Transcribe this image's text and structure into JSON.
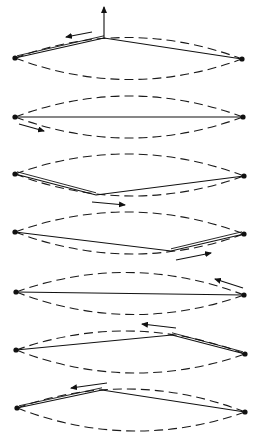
{
  "diagram": {
    "title": "",
    "colors": {
      "ink": "#111111",
      "background": "#ffffff"
    },
    "envelope_amplitude": 21,
    "panels": [
      {
        "id": 1,
        "left": [
          15,
          58
        ],
        "right": [
          242,
          59
        ],
        "kink": [
          104,
          38
        ],
        "doubled": "left",
        "arrows": [
          {
            "from": [
              104,
              38
            ],
            "to": [
              104,
              7
            ],
            "kind": "force-up-icon"
          },
          {
            "from": [
              92,
              32
            ],
            "to": [
              66,
              37
            ],
            "kind": "kink-direction-icon"
          }
        ]
      },
      {
        "id": 2,
        "left": [
          15,
          117
        ],
        "right": [
          243,
          117
        ],
        "kink": null,
        "doubled": "none",
        "arrows": [
          {
            "from": [
              19,
              124
            ],
            "to": [
              44,
              131
            ],
            "kind": "kink-direction-icon"
          }
        ]
      },
      {
        "id": 3,
        "left": [
          15,
          174
        ],
        "right": [
          244,
          176
        ],
        "kink": [
          96,
          195
        ],
        "doubled": "left",
        "arrows": [
          {
            "from": [
              92,
              202
            ],
            "to": [
              125,
              205
            ],
            "kind": "kink-direction-icon"
          }
        ]
      },
      {
        "id": 4,
        "left": [
          15,
          232
        ],
        "right": [
          244,
          234
        ],
        "kink": [
          171,
          251
        ],
        "doubled": "right",
        "arrows": [
          {
            "from": [
              176,
              260
            ],
            "to": [
              211,
              253
            ],
            "kind": "kink-direction-icon"
          }
        ]
      },
      {
        "id": 5,
        "left": [
          16,
          292
        ],
        "right": [
          244,
          295
        ],
        "kink": null,
        "doubled": "none",
        "arrows": [
          {
            "from": [
              243,
              288
            ],
            "to": [
              215,
              279
            ],
            "kind": "kink-direction-icon"
          }
        ]
      },
      {
        "id": 6,
        "left": [
          16,
          350
        ],
        "right": [
          245,
          354
        ],
        "kink": [
          172,
          335
        ],
        "doubled": "right",
        "arrows": [
          {
            "from": [
              176,
              328
            ],
            "to": [
              142,
              324
            ],
            "kind": "kink-direction-icon"
          },
          {
            "from": [
              107,
              383
            ],
            "to": [
              71,
              388
            ],
            "kind": "kink-direction-icon"
          }
        ]
      },
      {
        "id": 7,
        "left": [
          17,
          408
        ],
        "right": [
          245,
          412
        ],
        "kink": [
          102,
          390
        ],
        "doubled": "left",
        "arrows": []
      }
    ]
  }
}
